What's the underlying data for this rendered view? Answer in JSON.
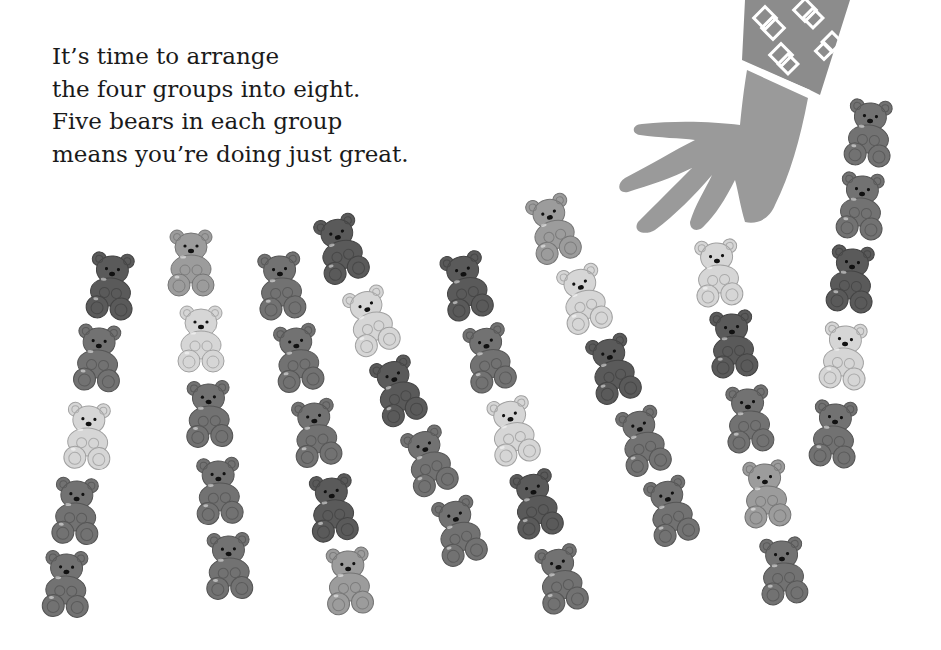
{
  "verse": {
    "lines": [
      "It’s time to arrange",
      "the four groups into eight.",
      "Five bears in each group",
      "means you’re doing just great."
    ]
  },
  "illustration": {
    "hand_color": "#9a9a9a",
    "sleeve_color": "#8c8c8c",
    "bear_count": 40,
    "group_count": 8,
    "bears_per_group": 5,
    "shades": {
      "dark": "#5a5a5a",
      "mid": "#727272",
      "lightmid": "#9c9c9c",
      "light": "#d6d6d6"
    },
    "groups": [
      {
        "bears": [
          {
            "x": 85,
            "y": 250,
            "s": "dark",
            "r": 5
          },
          {
            "x": 72,
            "y": 322,
            "s": "mid",
            "r": 4
          },
          {
            "x": 62,
            "y": 400,
            "s": "light",
            "r": 3
          },
          {
            "x": 50,
            "y": 475,
            "s": "mid",
            "r": 3
          },
          {
            "x": 40,
            "y": 548,
            "s": "mid",
            "r": 2
          }
        ]
      },
      {
        "bears": [
          {
            "x": 165,
            "y": 227,
            "s": "lightmid",
            "r": 0
          },
          {
            "x": 175,
            "y": 303,
            "s": "light",
            "r": 0
          },
          {
            "x": 183,
            "y": 378,
            "s": "mid",
            "r": -2
          },
          {
            "x": 193,
            "y": 455,
            "s": "mid",
            "r": -3
          },
          {
            "x": 203,
            "y": 530,
            "s": "mid",
            "r": -2
          }
        ]
      },
      {
        "bears": [
          {
            "x": 255,
            "y": 250,
            "s": "mid",
            "r": -5
          },
          {
            "x": 272,
            "y": 322,
            "s": "mid",
            "r": -8
          },
          {
            "x": 290,
            "y": 397,
            "s": "mid",
            "r": -8
          },
          {
            "x": 307,
            "y": 472,
            "s": "dark",
            "r": -6
          },
          {
            "x": 323,
            "y": 545,
            "s": "lightmid",
            "r": -4
          }
        ]
      },
      {
        "bears": [
          {
            "x": 315,
            "y": 213,
            "s": "dark",
            "r": -15
          },
          {
            "x": 345,
            "y": 285,
            "s": "light",
            "r": -18
          },
          {
            "x": 372,
            "y": 355,
            "s": "dark",
            "r": -18
          },
          {
            "x": 403,
            "y": 425,
            "s": "mid",
            "r": -18
          },
          {
            "x": 433,
            "y": 495,
            "s": "mid",
            "r": -15
          }
        ]
      },
      {
        "bears": [
          {
            "x": 440,
            "y": 250,
            "s": "dark",
            "r": -12
          },
          {
            "x": 463,
            "y": 322,
            "s": "mid",
            "r": -12
          },
          {
            "x": 487,
            "y": 395,
            "s": "light",
            "r": -12
          },
          {
            "x": 510,
            "y": 468,
            "s": "dark",
            "r": -12
          },
          {
            "x": 535,
            "y": 543,
            "s": "mid",
            "r": -12
          }
        ]
      },
      {
        "bears": [
          {
            "x": 527,
            "y": 193,
            "s": "lightmid",
            "r": -15
          },
          {
            "x": 558,
            "y": 263,
            "s": "light",
            "r": -15
          },
          {
            "x": 587,
            "y": 333,
            "s": "dark",
            "r": -15
          },
          {
            "x": 617,
            "y": 405,
            "s": "mid",
            "r": -15
          },
          {
            "x": 645,
            "y": 475,
            "s": "mid",
            "r": -15
          }
        ]
      },
      {
        "bears": [
          {
            "x": 692,
            "y": 237,
            "s": "light",
            "r": -5
          },
          {
            "x": 707,
            "y": 308,
            "s": "dark",
            "r": -5
          },
          {
            "x": 723,
            "y": 383,
            "s": "mid",
            "r": -5
          },
          {
            "x": 740,
            "y": 458,
            "s": "lightmid",
            "r": -5
          },
          {
            "x": 757,
            "y": 535,
            "s": "mid",
            "r": -5
          }
        ]
      },
      {
        "bears": [
          {
            "x": 843,
            "y": 97,
            "s": "mid",
            "r": 5
          },
          {
            "x": 835,
            "y": 170,
            "s": "mid",
            "r": 5
          },
          {
            "x": 825,
            "y": 243,
            "s": "dark",
            "r": 5
          },
          {
            "x": 818,
            "y": 320,
            "s": "light",
            "r": 5
          },
          {
            "x": 808,
            "y": 398,
            "s": "mid",
            "r": 5
          }
        ]
      }
    ]
  }
}
